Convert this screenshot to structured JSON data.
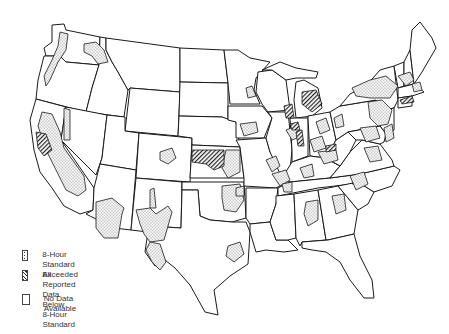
{
  "map": {
    "subject": "United States — 8-hour standard status by area",
    "region": "Contiguous United States",
    "colors": {
      "outline": "#1a1a1a",
      "background": "#ffffff",
      "pattern_ink": "#333333"
    }
  },
  "legend": {
    "items": [
      {
        "key": "exceeded",
        "pattern": "stipple-dots",
        "label": "8-Hour Standard Exceeded"
      },
      {
        "key": "below",
        "pattern": "diagonal-hatch",
        "label": "All Reported Data Below\n8-Hour Standard"
      },
      {
        "key": "nodata",
        "pattern": "blank",
        "label": "No Data Available"
      }
    ]
  }
}
